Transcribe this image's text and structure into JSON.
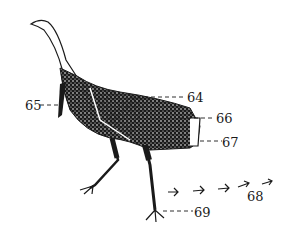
{
  "figure": {
    "labels": [
      {
        "id": "64",
        "text": "64"
      },
      {
        "id": "65",
        "text": "65"
      },
      {
        "id": "66",
        "text": "66"
      },
      {
        "id": "67",
        "text": "67"
      },
      {
        "id": "68",
        "text": "68"
      },
      {
        "id": "69",
        "text": "69"
      }
    ],
    "colors": {
      "ink": "#1a1a1a",
      "background": "#ffffff"
    }
  }
}
